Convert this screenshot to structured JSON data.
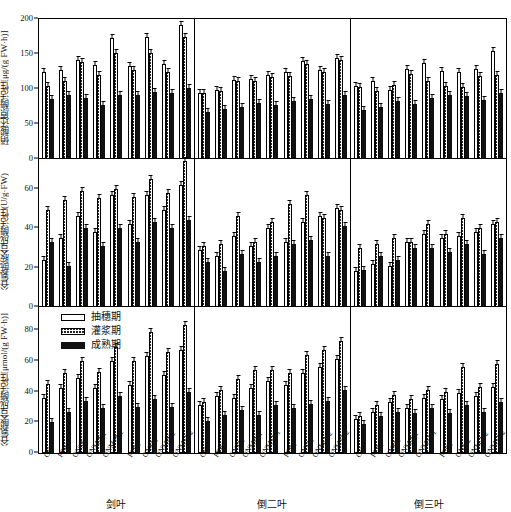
{
  "chart_data": {
    "type": "bar",
    "title": "",
    "xlabel": "",
    "grid": false,
    "legend_position": "panel-3 top-left",
    "series_names": [
      "抽穗期",
      "灌浆期",
      "成熟期"
    ],
    "categories": [
      "CK",
      "FFP1",
      "ONM1",
      "ONM-N1",
      "ONM+N1",
      "FFP2",
      "ONM2",
      "ONM-N2",
      "ONM+N2"
    ],
    "groups": [
      "剑叶",
      "倒二叶",
      "倒三叶"
    ],
    "panels": [
      {
        "id": "p1",
        "ylabel": "硝酸还原酶活性[μg/(g FW·h)]",
        "ylim": [
          0,
          200
        ],
        "yticks": [
          0,
          50,
          100,
          150,
          200
        ],
        "groups": [
          {
            "name": "剑叶",
            "series": [
              {
                "name": "抽穗期",
                "values": [
                  125,
                  127,
                  142,
                  134,
                  173,
                  133,
                  174,
                  136,
                  192
                ]
              },
              {
                "name": "灌浆期",
                "values": [
                  104,
                  111,
                  139,
                  120,
                  152,
                  127,
                  152,
                  124,
                  175
                ]
              },
              {
                "name": "成熟期",
                "values": [
                  86,
                  92,
                  87,
                  77,
                  91,
                  92,
                  96,
                  95,
                  101
                ]
              }
            ]
          },
          {
            "name": "倒二叶",
            "series": [
              {
                "name": "抽穗期",
                "values": [
                  95,
                  98,
                  113,
                  115,
                  120,
                  124,
                  140,
                  127,
                  145
                ]
              },
              {
                "name": "灌浆期",
                "values": [
                  94,
                  97,
                  112,
                  112,
                  117,
                  118,
                  136,
                  124,
                  141
                ]
              },
              {
                "name": "成熟期",
                "values": [
                  67,
                  71,
                  75,
                  80,
                  77,
                  83,
                  86,
                  79,
                  92
                ]
              }
            ]
          },
          {
            "name": "倒三叶",
            "series": [
              {
                "name": "抽穗期",
                "values": [
                  105,
                  112,
                  99,
                  128,
                  137,
                  126,
                  124,
                  128,
                  155
                ]
              },
              {
                "name": "灌浆期",
                "values": [
                  103,
                  97,
                  106,
                  122,
                  112,
                  104,
                  103,
                  118,
                  120
                ]
              },
              {
                "name": "成熟期",
                "values": [
                  70,
                  75,
                  83,
                  78,
                  87,
                  92,
                  90,
                  85,
                  94
                ]
              }
            ]
          }
        ]
      },
      {
        "id": "p2",
        "ylabel": "谷氨酰胺合成酶活性(U/g·FW)",
        "ylim": [
          0,
          75
        ],
        "yticks": [
          0,
          20,
          40,
          60
        ],
        "groups": [
          {
            "name": "剑叶",
            "series": [
              {
                "name": "抽穗期",
                "values": [
                  24,
                  35,
                  46,
                  38,
                  57,
                  42,
                  57,
                  49,
                  62
                ]
              },
              {
                "name": "灌浆期",
                "values": [
                  49,
                  54,
                  59,
                  55,
                  60,
                  56,
                  65,
                  58,
                  74
                ]
              },
              {
                "name": "成熟期",
                "values": [
                  33,
                  21,
                  40,
                  31,
                  40,
                  33,
                  43,
                  40,
                  44
                ]
              }
            ]
          },
          {
            "name": "倒二叶",
            "series": [
              {
                "name": "抽穗期",
                "values": [
                  29,
                  26,
                  36,
                  31,
                  40,
                  33,
                  43,
                  46,
                  50
                ]
              },
              {
                "name": "灌浆期",
                "values": [
                  31,
                  32,
                  46,
                  33,
                  43,
                  52,
                  57,
                  45,
                  49
                ]
              },
              {
                "name": "成熟期",
                "values": [
                  23,
                  18,
                  27,
                  23,
                  26,
                  32,
                  34,
                  26,
                  41
                ]
              }
            ]
          },
          {
            "name": "倒三叶",
            "series": [
              {
                "name": "抽穗期",
                "values": [
                  18,
                  22,
                  21,
                  33,
                  37,
                  35,
                  36,
                  38,
                  42
                ]
              },
              {
                "name": "灌浆期",
                "values": [
                  30,
                  32,
                  35,
                  33,
                  42,
                  37,
                  45,
                  40,
                  43
                ]
              },
              {
                "name": "成熟期",
                "values": [
                  19,
                  26,
                  24,
                  30,
                  30,
                  28,
                  32,
                  27,
                  35
                ]
              }
            ]
          }
        ]
      },
      {
        "id": "p3",
        "ylabel": "谷氨酸合成酶活性[μmol/(g FW·h)]",
        "ylim": [
          0,
          95
        ],
        "yticks": [
          0,
          20,
          40,
          60,
          80
        ],
        "groups": [
          {
            "name": "剑叶",
            "series": [
              {
                "name": "抽穗期",
                "values": [
                  36,
                  42,
                  49,
                  42,
                  60,
                  44,
                  63,
                  51,
                  67
                ]
              },
              {
                "name": "灌浆期",
                "values": [
                  45,
                  52,
                  60,
                  53,
                  69,
                  60,
                  79,
                  66,
                  83
                ]
              },
              {
                "name": "成熟期",
                "values": [
                  20,
                  27,
                  34,
                  29,
                  37,
                  30,
                  35,
                  30,
                  40
                ]
              }
            ]
          },
          {
            "name": "倒二叶",
            "series": [
              {
                "name": "抽穗期",
                "values": [
                  31,
                  37,
                  36,
                  42,
                  47,
                  44,
                  52,
                  56,
                  61
                ]
              },
              {
                "name": "灌浆期",
                "values": [
                  33,
                  41,
                  48,
                  54,
                  54,
                  52,
                  64,
                  67,
                  73
                ]
              },
              {
                "name": "成熟期",
                "values": [
                  21,
                  25,
                  28,
                  25,
                  31,
                  29,
                  32,
                  34,
                  41
                ]
              }
            ]
          },
          {
            "name": "倒三叶",
            "series": [
              {
                "name": "抽穗期",
                "values": [
                  22,
                  27,
                  33,
                  29,
                  36,
                  35,
                  39,
                  37,
                  43
                ]
              },
              {
                "name": "灌浆期",
                "values": [
                  24,
                  31,
                  38,
                  35,
                  41,
                  40,
                  56,
                  43,
                  58
                ]
              },
              {
                "name": "成熟期",
                "values": [
                  19,
                  24,
                  27,
                  26,
                  29,
                  26,
                  31,
                  27,
                  33
                ]
              }
            ]
          }
        ]
      }
    ]
  }
}
